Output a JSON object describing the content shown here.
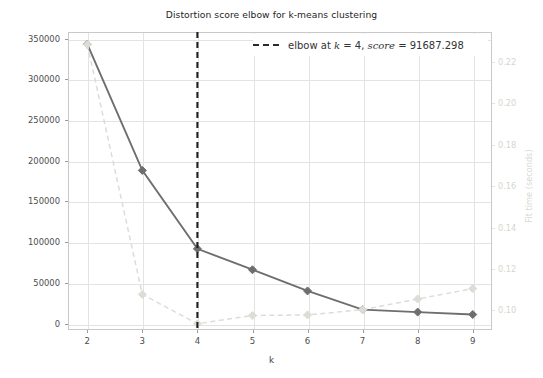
{
  "chart_data": {
    "type": "line",
    "title": "Distortion score elbow for k-means clustering",
    "xlabel": "k",
    "ylabel": "Distortion score",
    "y2label": "Fit time (seconds)",
    "x": [
      2,
      3,
      4,
      5,
      6,
      7,
      8,
      9
    ],
    "xticklabels": [
      "2",
      "3",
      "4",
      "5",
      "6",
      "7",
      "8",
      "9"
    ],
    "xlim": [
      1.65,
      9.35
    ],
    "yticklabels": [
      "0",
      "50000",
      "100000",
      "150000",
      "200000",
      "250000",
      "300000",
      "350000"
    ],
    "yticks": [
      0,
      50000,
      100000,
      150000,
      200000,
      250000,
      300000,
      350000
    ],
    "ylim": [
      -8000,
      358000
    ],
    "y2ticklabels": [
      "0.10",
      "0.12",
      "0.14",
      "0.16",
      "0.18",
      "0.20",
      "0.22"
    ],
    "y2ticks": [
      0.1,
      0.12,
      0.14,
      0.16,
      0.18,
      0.2,
      0.22
    ],
    "y2lim": [
      0.0905,
      0.2345
    ],
    "grid": true,
    "legend_position": "upper right",
    "series": [
      {
        "name": "distortion score",
        "axis": "left",
        "color": "#6e6e6e",
        "linestyle": "solid",
        "marker": "diamond",
        "values": [
          343000,
          188000,
          91687.298,
          66000,
          40000,
          17000,
          14000,
          11000
        ]
      },
      {
        "name": "fit time",
        "axis": "right",
        "color": "#d9ded6",
        "linestyle": "dashed",
        "marker": "diamond",
        "values": [
          0.2285,
          0.1077,
          0.0935,
          0.0975,
          0.0978,
          0.1003,
          0.1055,
          0.1105
        ]
      }
    ],
    "annotations": [
      {
        "type": "vline",
        "name": "elbow-line",
        "x": 4,
        "color": "#1f1f1f",
        "linestyle": "dashed",
        "label": "elbow at k = 4, score = 91687.298"
      }
    ],
    "legend": {
      "entries": [
        {
          "label_plain": "elbow at k = 4, score = 91687.298",
          "label_prefix": "elbow at ",
          "k_symbol": "k",
          "k_eq": " = 4, ",
          "score_symbol": "score",
          "score_eq": " = 91687.298",
          "dash_color": "#2b2b2b"
        }
      ]
    },
    "colors": {
      "distortion_line": "#6e6e6e",
      "fit_time_line": "#d9ded6",
      "elbow_line": "#1f1f1f",
      "grid": "#e3e3e3",
      "frame": "#c9c9c9",
      "text": "#3d3d3d",
      "right_axis_text": "#d2d7cf",
      "background": "#ffffff"
    }
  }
}
